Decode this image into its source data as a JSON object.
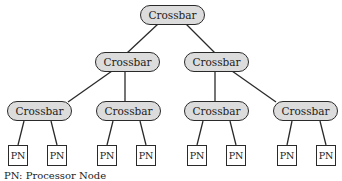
{
  "diagram": {
    "type": "tree",
    "crossbar_label": "Crossbar",
    "pn_label": "PN",
    "legend": "PN: Processor Node",
    "levels": [
      {
        "level": 0,
        "nodes": [
          "Crossbar"
        ]
      },
      {
        "level": 1,
        "nodes": [
          "Crossbar",
          "Crossbar"
        ]
      },
      {
        "level": 2,
        "nodes": [
          "Crossbar",
          "Crossbar",
          "Crossbar",
          "Crossbar"
        ]
      },
      {
        "level": 3,
        "nodes": [
          "PN",
          "PN",
          "PN",
          "PN",
          "PN",
          "PN",
          "PN",
          "PN"
        ]
      }
    ],
    "edges": [
      [
        "root",
        "mid-left"
      ],
      [
        "root",
        "mid-right"
      ],
      [
        "mid-left",
        "low-1"
      ],
      [
        "mid-left",
        "low-2"
      ],
      [
        "mid-right",
        "low-3"
      ],
      [
        "mid-right",
        "low-4"
      ],
      [
        "low-1",
        "pn-1"
      ],
      [
        "low-1",
        "pn-2"
      ],
      [
        "low-2",
        "pn-3"
      ],
      [
        "low-2",
        "pn-4"
      ],
      [
        "low-3",
        "pn-5"
      ],
      [
        "low-3",
        "pn-6"
      ],
      [
        "low-4",
        "pn-7"
      ],
      [
        "low-4",
        "pn-8"
      ]
    ],
    "colors": {
      "crossbar_fill": "#dcdcdc",
      "stroke": "#2a2a2a",
      "pn_fill": "#ffffff"
    }
  }
}
